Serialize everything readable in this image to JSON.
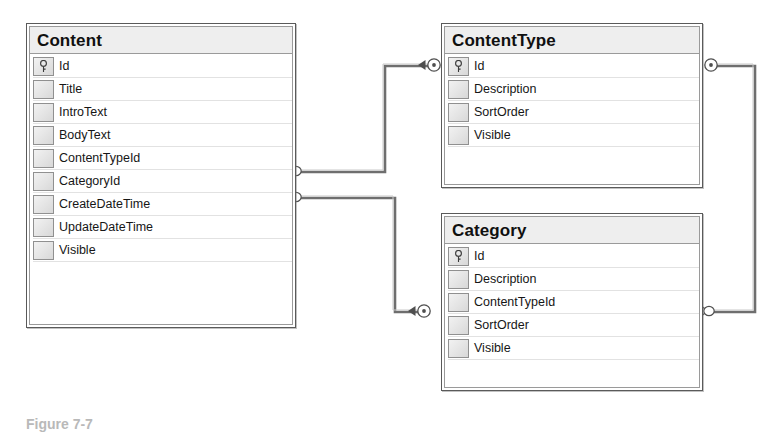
{
  "diagram": {
    "type": "entity-relationship-diagram",
    "caption": "Figure 7-7",
    "background_color": "#ffffff",
    "line_color": "#6e6e6e",
    "header_color": "#eeeeee",
    "border_color": "#5a5a5a",
    "text_color": "#161616"
  },
  "tables": [
    {
      "id": "content",
      "name": "Content",
      "x": 26,
      "y": 23,
      "width": 270,
      "height": 305,
      "columns": [
        {
          "name": "Id",
          "key": true
        },
        {
          "name": "Title",
          "key": false
        },
        {
          "name": "IntroText",
          "key": false
        },
        {
          "name": "BodyText",
          "key": false
        },
        {
          "name": "ContentTypeId",
          "key": false
        },
        {
          "name": "CategoryId",
          "key": false
        },
        {
          "name": "CreateDateTime",
          "key": false
        },
        {
          "name": "UpdateDateTime",
          "key": false
        },
        {
          "name": "Visible",
          "key": false
        }
      ]
    },
    {
      "id": "contenttype",
      "name": "ContentType",
      "x": 441,
      "y": 23,
      "width": 262,
      "height": 165,
      "columns": [
        {
          "name": "Id",
          "key": true
        },
        {
          "name": "Description",
          "key": false
        },
        {
          "name": "SortOrder",
          "key": false
        },
        {
          "name": "Visible",
          "key": false
        }
      ]
    },
    {
      "id": "category",
      "name": "Category",
      "x": 441,
      "y": 213,
      "width": 262,
      "height": 178,
      "columns": [
        {
          "name": "Id",
          "key": true
        },
        {
          "name": "Description",
          "key": false
        },
        {
          "name": "ContentTypeId",
          "key": false
        },
        {
          "name": "SortOrder",
          "key": false
        },
        {
          "name": "Visible",
          "key": false
        }
      ]
    }
  ],
  "relationships": [
    {
      "id": "rel-content-contenttype",
      "from_table": "Content",
      "from_column": "ContentTypeId",
      "from_notation": "many",
      "to_table": "ContentType",
      "to_column": "Id",
      "to_notation": "key"
    },
    {
      "id": "rel-content-category",
      "from_table": "Content",
      "from_column": "CategoryId",
      "from_notation": "many",
      "to_table": "Category",
      "to_column": "Id",
      "to_notation": "key"
    },
    {
      "id": "rel-contenttype-category",
      "from_table": "ContentType",
      "from_column": "Id",
      "from_notation": "key",
      "to_table": "Category",
      "to_column": "ContentTypeId",
      "to_notation": "many"
    }
  ],
  "icons": {
    "primary_key": "key-icon",
    "column_handle": "column-handle-icon",
    "many_end": "crowsfoot-many-icon",
    "one_end": "key-relationship-icon"
  }
}
